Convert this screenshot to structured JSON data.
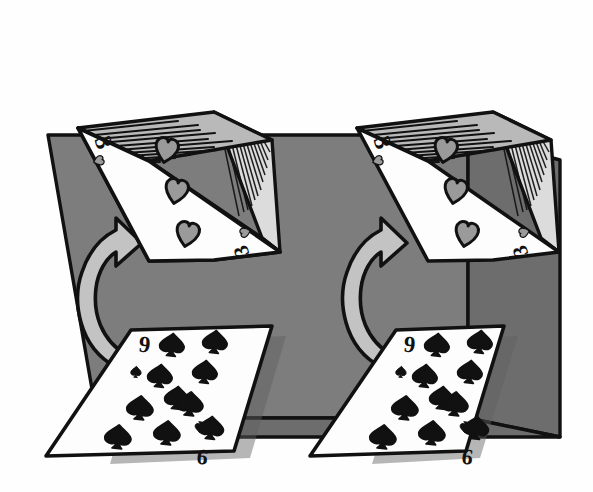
{
  "scene": {
    "title": "Two identical card dealing diagrams",
    "description": "A deck of playing cards with a 3 of Hearts face up on top, a curved arrow pointing up from a 9 of Spades card lying on a gray table.",
    "background_color": "#ffffff",
    "table_color": "#7d7d7d",
    "table_shadow_color": "#6a6a6a",
    "deck_top_color": "#b9b9b9",
    "deck_edge_color": "#d8d8d8",
    "card_face_color": "#fdfdfd",
    "arrow_fill_color": "#c3c3c3",
    "ink_color": "#111111",
    "pip_red_color": "#9a9a9a",
    "pip_black_color": "#111111"
  },
  "groups": [
    {
      "id": "left",
      "name": "left-card-group",
      "deck": {
        "name": "left-deck",
        "top_card": {
          "rank": "3",
          "suit": "hearts",
          "suit_symbol": "♥",
          "pip_count": 3,
          "corner_index_top": "3",
          "corner_index_bottom": "3",
          "label": "3 of Hearts"
        },
        "hatch_lines_top": 11,
        "hatch_lines_side": 13
      },
      "arrow": {
        "name": "left-curved-arrow",
        "direction": "up",
        "shape": "curved-c-arrow"
      },
      "table_card": {
        "name": "left-table-card",
        "rank": "9",
        "suit": "spades",
        "suit_symbol": "♠",
        "pip_count": 9,
        "corner_index_top": "9",
        "corner_index_bottom": "9",
        "label": "9 of Spades"
      }
    },
    {
      "id": "right",
      "name": "right-card-group",
      "deck": {
        "name": "right-deck",
        "top_card": {
          "rank": "3",
          "suit": "hearts",
          "suit_symbol": "♥",
          "pip_count": 3,
          "corner_index_top": "3",
          "corner_index_bottom": "3",
          "label": "3 of Hearts"
        },
        "hatch_lines_top": 11,
        "hatch_lines_side": 13
      },
      "arrow": {
        "name": "right-curved-arrow",
        "direction": "up",
        "shape": "curved-c-arrow"
      },
      "table_card": {
        "name": "right-table-card",
        "rank": "9",
        "suit": "spades",
        "suit_symbol": "♠",
        "pip_count": 9,
        "corner_index_top": "9",
        "corner_index_bottom": "9",
        "label": "9 of Spades"
      }
    }
  ],
  "labels": {
    "rank_three": "3",
    "rank_nine": "9"
  }
}
